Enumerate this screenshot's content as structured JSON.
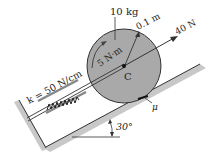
{
  "diagram": {
    "labels": {
      "mass": "10 kg",
      "radius": "0.1 m",
      "force": "40 N",
      "moment": "5 N·m",
      "center": "C",
      "spring": "k = 50 N/cm",
      "friction": "μ",
      "angle": "30°"
    },
    "values": {
      "mass_kg": 10,
      "radius_m": 0.1,
      "force_N": 40,
      "moment_Nm": 5,
      "spring_constant_N_per_cm": 50,
      "incline_deg": 30
    },
    "colors": {
      "disk_fill": "#a9a9a9",
      "incline_shade": "#c8c8c8",
      "line": "#222222"
    }
  }
}
